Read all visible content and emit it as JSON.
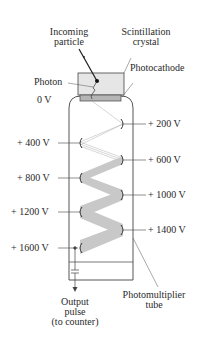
{
  "diagram": {
    "labels": {
      "incoming_particle": [
        "Incoming",
        "particle"
      ],
      "scintillation_crystal": [
        "Scintillation",
        "crystal"
      ],
      "photon": "Photon",
      "photocathode": "Photocathode",
      "zero_volt": "0 V",
      "photomultiplier_tube": [
        "Photomultiplier",
        "tube"
      ],
      "output_pulse": [
        "Output",
        "pulse",
        "(to counter)"
      ]
    },
    "dynodes": [
      {
        "voltage": "+ 200 V",
        "side": "right"
      },
      {
        "voltage": "+ 400 V",
        "side": "left"
      },
      {
        "voltage": "+ 600 V",
        "side": "right"
      },
      {
        "voltage": "+ 800 V",
        "side": "left"
      },
      {
        "voltage": "+ 1000 V",
        "side": "right"
      },
      {
        "voltage": "+ 1200 V",
        "side": "left"
      },
      {
        "voltage": "+ 1400 V",
        "side": "right"
      },
      {
        "voltage": "+ 1600 V",
        "side": "left"
      }
    ],
    "colors": {
      "line": "#333333",
      "crystal_fill": "#e6e6e6",
      "photocathode_fill": "#b5b5b5",
      "electron_beam": "#c8c8c8"
    }
  }
}
